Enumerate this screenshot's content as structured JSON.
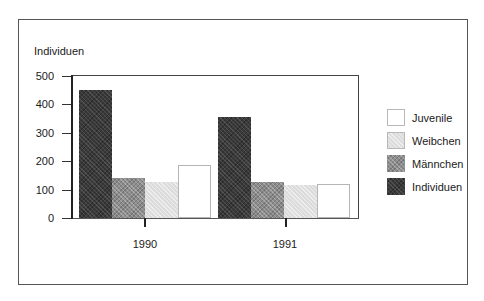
{
  "chart_data": {
    "type": "bar",
    "title": "",
    "xlabel": "",
    "ylabel": "Individuen",
    "ylim": [
      0,
      500
    ],
    "yticks": [
      0,
      100,
      200,
      300,
      400,
      500
    ],
    "grid": false,
    "legend_position": "right",
    "categories": [
      "1990",
      "1991"
    ],
    "series": [
      {
        "name": "Individuen",
        "values": [
          450,
          355
        ]
      },
      {
        "name": "Männchen",
        "values": [
          140,
          125
        ]
      },
      {
        "name": "Weibchen",
        "values": [
          125,
          115
        ]
      },
      {
        "name": "Juvenile",
        "values": [
          185,
          120
        ]
      }
    ]
  },
  "axis": {
    "y_title": "Individuen",
    "y_ticks": [
      "0",
      "100",
      "200",
      "300",
      "400",
      "500"
    ],
    "x_ticks": [
      "1990",
      "1991"
    ]
  },
  "legend": [
    {
      "label": "Juvenile"
    },
    {
      "label": "Weibchen"
    },
    {
      "label": "Männchen"
    },
    {
      "label": "Individuen"
    }
  ],
  "colors": {
    "individuen": "#3a3a3a",
    "maennchen": "#8c8c8c",
    "weibchen": "#dcdcdc",
    "juvenile": "#ffffff"
  }
}
